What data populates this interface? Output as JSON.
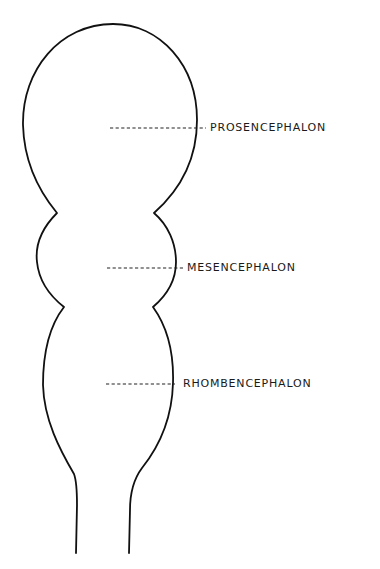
{
  "figure": {
    "background_color": "#ffffff",
    "line_color": "#111111"
  },
  "labels": [
    {
      "id": "prosencephalon",
      "text": "PROSENCEPHALON",
      "leader_from_x": 110,
      "leader_to_x": 206,
      "y": 128
    },
    {
      "id": "mesencephalon",
      "text": "MESENCEPHALON",
      "leader_from_x": 107,
      "leader_to_x": 183,
      "y": 268
    },
    {
      "id": "rhombencephalon",
      "text": "RHOMBENCEPHALON",
      "leader_from_x": 106,
      "leader_to_x": 175,
      "y": 384
    }
  ]
}
